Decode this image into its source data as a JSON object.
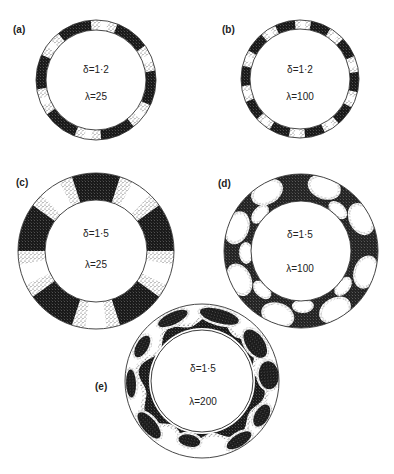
{
  "figure": {
    "panels": [
      {
        "id": "a",
        "label": "(a)",
        "delta": "δ=1·2",
        "lambda": "λ=25",
        "cx": 96,
        "cy": 80,
        "R": 60,
        "r": 50,
        "pattern": "bands",
        "bands": 6,
        "offset": -22,
        "width": 34
      },
      {
        "id": "b",
        "label": "(b)",
        "delta": "δ=1·2",
        "lambda": "λ=100",
        "cx": 300,
        "cy": 79,
        "R": 59,
        "r": 50,
        "pattern": "bands",
        "bands": 10,
        "offset": -15,
        "width": 20
      },
      {
        "id": "c",
        "label": "(c)",
        "delta": "δ=1·5",
        "lambda": "λ=25",
        "cx": 96,
        "cy": 251,
        "R": 78,
        "r": 51,
        "pattern": "bands",
        "bands": 5,
        "offset": 0,
        "width": 36
      },
      {
        "id": "d",
        "label": "(d)",
        "delta": "δ=1·5",
        "lambda": "λ=100",
        "cx": 301,
        "cy": 251,
        "R": 77,
        "r": 50,
        "pattern": "cells"
      },
      {
        "id": "e",
        "label": "(e)",
        "delta": "δ=1·5",
        "lambda": "λ=200",
        "cx": 202,
        "cy": 381,
        "R": 77,
        "r": 51,
        "pattern": "wavy"
      }
    ],
    "colors": {
      "background": "#ffffff",
      "stroke": "#333333",
      "dark": "#1c1c1c",
      "stipple": "#555555"
    }
  }
}
